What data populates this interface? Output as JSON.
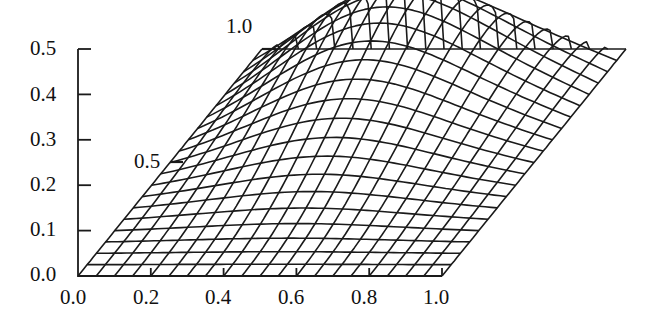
{
  "chart_data": {
    "type": "surface-3d-wireframe",
    "title": "",
    "xlabel": "",
    "ylabel": "",
    "zlabel": "",
    "x_ticks": [
      "0.0",
      "0.2",
      "0.4",
      "0.6",
      "0.8",
      "1.0"
    ],
    "x_range": [
      0.0,
      1.0
    ],
    "depth_ticks": [
      "0.5",
      "1.0"
    ],
    "depth_range": [
      0.0,
      1.0
    ],
    "z_ticks": [
      "0.0",
      "0.1",
      "0.2",
      "0.3",
      "0.4",
      "0.5"
    ],
    "z_range": [
      0.0,
      0.5
    ],
    "grid": {
      "x_lines": 21,
      "depth_lines": 21
    },
    "surface": {
      "description": "Wireframe surface, zero on all four boundary edges, rising to a ridge near the back (depth ~0.9-1.0), peak roughly at x~0.4-0.5",
      "peak_value_approx": 0.23,
      "peak_location_approx": {
        "x": 0.45,
        "depth": 0.92
      }
    },
    "line_color": "#1a1a1a",
    "background": "#ffffff"
  }
}
